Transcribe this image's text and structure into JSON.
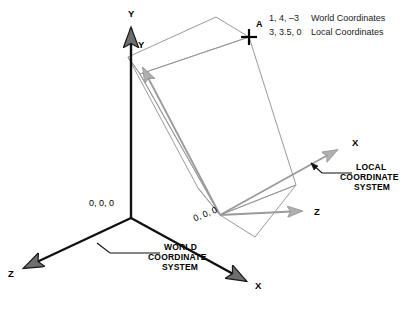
{
  "diagram": {
    "background_color": "#ffffff",
    "world_axis_color": "#000000",
    "local_axis_color": "#8c8c8c",
    "box_color": "#9a9a9a",
    "world_axes": {
      "y_label": "Y",
      "x_label": "X",
      "z_label": "Z",
      "origin_label": "0, 0, 0",
      "callout_line1": "WORLD",
      "callout_line2": "COORDINATE",
      "callout_line3": "SYSTEM"
    },
    "local_axes": {
      "y_label": "Y",
      "x_label": "X",
      "z_label": "Z",
      "origin_label": "0, 0, 0",
      "callout_line1": "LOCAL",
      "callout_line2": "COORDINATE",
      "callout_line3": "SYSTEM"
    },
    "point": {
      "label": "A",
      "world_coordinates": "1, 4, –3",
      "world_caption": "World Coordinates",
      "local_coordinates": "3, 3.5, 0",
      "local_caption": "Local Coordinates"
    }
  }
}
